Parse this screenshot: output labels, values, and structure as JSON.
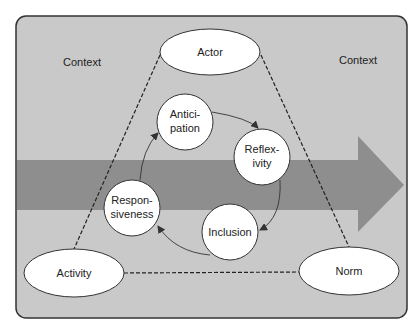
{
  "diagram": {
    "context_labels": [
      "Context",
      "Context"
    ],
    "triangle_nodes": {
      "actor": "Actor",
      "activity": "Activity",
      "norm": "Norm"
    },
    "cycle_nodes": [
      {
        "line1": "Antici-",
        "line2": "pation"
      },
      {
        "line1": "Reflex-",
        "line2": "ivity"
      },
      {
        "line1": "Inclusion",
        "line2": ""
      },
      {
        "line1": "Respon-",
        "line2": "siveness"
      }
    ],
    "colors": {
      "background": "#c9c9c9",
      "arrow": "#8e8e8e",
      "border": "#333333",
      "node_fill": "#ffffff"
    }
  }
}
